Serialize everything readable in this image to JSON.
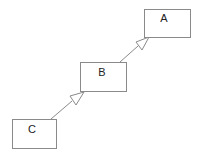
{
  "diagram": {
    "type": "uml-class-inheritance",
    "nodes": [
      {
        "id": "A",
        "label": "A",
        "x": 144,
        "y": 9,
        "w": 46,
        "h": 28
      },
      {
        "id": "B",
        "label": "B",
        "x": 80,
        "y": 62,
        "w": 46,
        "h": 29
      },
      {
        "id": "C",
        "label": "C",
        "x": 12,
        "y": 119,
        "w": 44,
        "h": 29
      }
    ],
    "edges": [
      {
        "from": "B",
        "to": "A",
        "arrow": "hollow-triangle"
      },
      {
        "from": "C",
        "to": "B",
        "arrow": "hollow-triangle"
      }
    ],
    "colors": {
      "stroke": "#8a8a8a",
      "text": "#222222",
      "background": "#ffffff"
    }
  }
}
